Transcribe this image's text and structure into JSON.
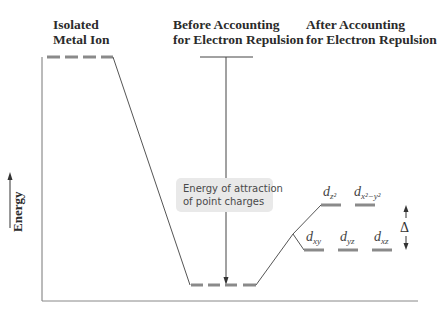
{
  "headers": {
    "isolated": {
      "line1": "Isolated",
      "line2": "Metal Ion"
    },
    "before": {
      "line1": "Before Accounting",
      "line2": "for Electron Repulsion"
    },
    "after": {
      "line1": "After Accounting",
      "line2": "for Electron Repulsion"
    }
  },
  "axis": {
    "y_label": "Energy"
  },
  "callout": {
    "line1": "Energy of attraction",
    "line2": "of point charges"
  },
  "orbitals": {
    "upper": [
      {
        "base": "d",
        "sub": "z²"
      },
      {
        "base": "d",
        "sub": "x²−y²"
      }
    ],
    "lower": [
      {
        "base": "d",
        "sub": "xy"
      },
      {
        "base": "d",
        "sub": "yz"
      },
      {
        "base": "d",
        "sub": "xz"
      }
    ]
  },
  "splitting_label": "Δ",
  "colors": {
    "level": "#8a8a8a",
    "line": "#555555",
    "callout_bg": "#e9e9e9"
  }
}
